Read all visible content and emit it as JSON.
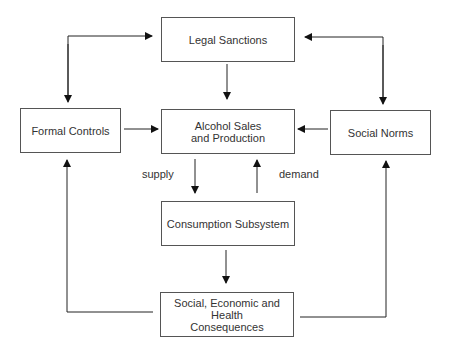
{
  "diagram": {
    "nodes": {
      "legal_sanctions": "Legal Sanctions",
      "formal_controls": "Formal Controls",
      "alcohol_sales": "Alcohol Sales and Production",
      "social_norms": "Social Norms",
      "consumption": "Consumption Subsystem",
      "consequences": "Social, Economic and Health Consequences"
    },
    "edge_labels": {
      "supply": "supply",
      "demand": "demand"
    },
    "edges": [
      {
        "from": "formal_controls",
        "to": "legal_sanctions",
        "bidirectional": true
      },
      {
        "from": "social_norms",
        "to": "legal_sanctions",
        "bidirectional": true
      },
      {
        "from": "legal_sanctions",
        "to": "alcohol_sales"
      },
      {
        "from": "formal_controls",
        "to": "alcohol_sales"
      },
      {
        "from": "social_norms",
        "to": "alcohol_sales"
      },
      {
        "from": "alcohol_sales",
        "to": "consumption",
        "label": "supply"
      },
      {
        "from": "consumption",
        "to": "alcohol_sales",
        "label": "demand"
      },
      {
        "from": "consumption",
        "to": "consequences"
      },
      {
        "from": "consequences",
        "to": "formal_controls"
      },
      {
        "from": "consequences",
        "to": "social_norms"
      }
    ],
    "colors": {
      "line": "#111111",
      "border": "#555555",
      "text": "#333333"
    }
  }
}
